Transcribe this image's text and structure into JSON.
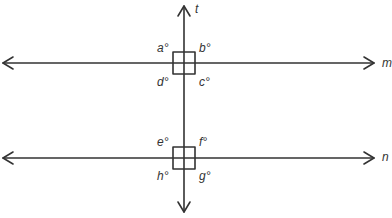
{
  "diagram": {
    "line_color": "#333333",
    "lines": {
      "transversal": {
        "label": "t"
      },
      "upper": {
        "label": "m"
      },
      "lower": {
        "label": "n"
      }
    },
    "angles_upper": {
      "top_left": "a°",
      "top_right": "b°",
      "bottom_right": "c°",
      "bottom_left": "d°"
    },
    "angles_lower": {
      "top_left": "e°",
      "top_right": "f°",
      "bottom_right": "g°",
      "bottom_left": "h°"
    },
    "right_angle_markers": 2
  }
}
